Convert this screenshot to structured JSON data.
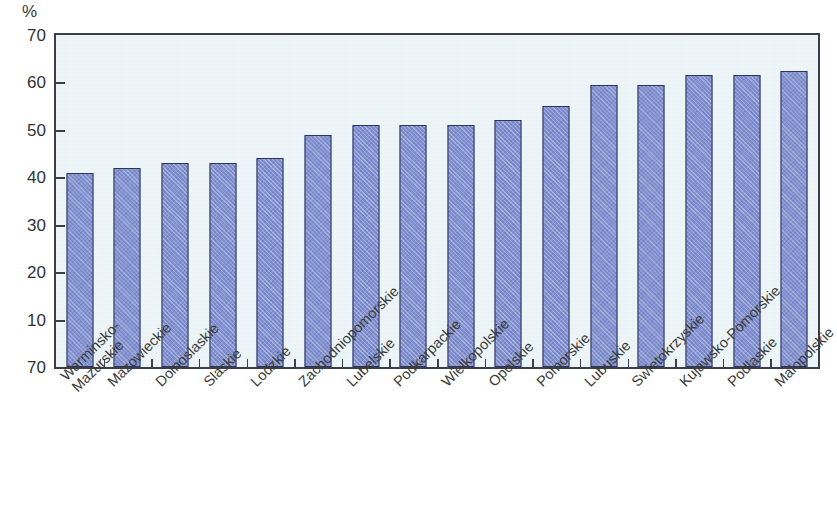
{
  "chart_data": {
    "type": "bar",
    "title": "",
    "subtitle": "",
    "xlabel": "",
    "ylabel": "",
    "unit_label": "%",
    "ylim": [
      0,
      70
    ],
    "ytick_labels": [
      "70",
      "60",
      "50",
      "40",
      "30",
      "20",
      "10",
      "70"
    ],
    "ytick_values": [
      70,
      60,
      50,
      40,
      30,
      20,
      10,
      0
    ],
    "grid": false,
    "legend": null,
    "legend_position": "none",
    "bar_color": "#8090d0",
    "bar_border_color": "#2f3558",
    "plot_background": "#eaf3f6",
    "axis_color": "#3b3f4a",
    "text_color": "#3a3a3a",
    "categories": [
      "Warminsko-",
      "Mazowieckie",
      "Dolnoslaskie",
      "Slaskie",
      "Lodzkie",
      "Zachodniopomorskie",
      "Lubelskie",
      "Podkarpackie",
      "Wielkopolskie",
      "Opolskie",
      "Pomorskie",
      "Lubuskie",
      "Swietokrzyskie",
      "Kujawsko-Pomorskie",
      "Podlaskie",
      "Malopolskie"
    ],
    "category_labels": [
      {
        "line1": "Warminsko-",
        "line2": "Mazurskie"
      },
      {
        "line1": "Mazowieckie",
        "line2": ""
      },
      {
        "line1": "Dolnoslaskie",
        "line2": ""
      },
      {
        "line1": "Slaskie",
        "line2": ""
      },
      {
        "line1": "Lodzkie",
        "line2": ""
      },
      {
        "line1": "Zachodniopomorskie",
        "line2": ""
      },
      {
        "line1": "Lubelskie",
        "line2": ""
      },
      {
        "line1": "Podkarpackie",
        "line2": ""
      },
      {
        "line1": "Wielkopolskie",
        "line2": ""
      },
      {
        "line1": "Opolskie",
        "line2": ""
      },
      {
        "line1": "Pomorskie",
        "line2": ""
      },
      {
        "line1": "Lubuskie",
        "line2": ""
      },
      {
        "line1": "Swietokrzyskie",
        "line2": ""
      },
      {
        "line1": "Kujawsko-Pomorskie",
        "line2": ""
      },
      {
        "line1": "Podlaskie",
        "line2": ""
      },
      {
        "line1": "Malopolskie",
        "line2": ""
      }
    ],
    "values": [
      41,
      42,
      43,
      43,
      44,
      49,
      51,
      51,
      51,
      52,
      55,
      59.5,
      59.5,
      61.5,
      61.5,
      62.5
    ]
  }
}
